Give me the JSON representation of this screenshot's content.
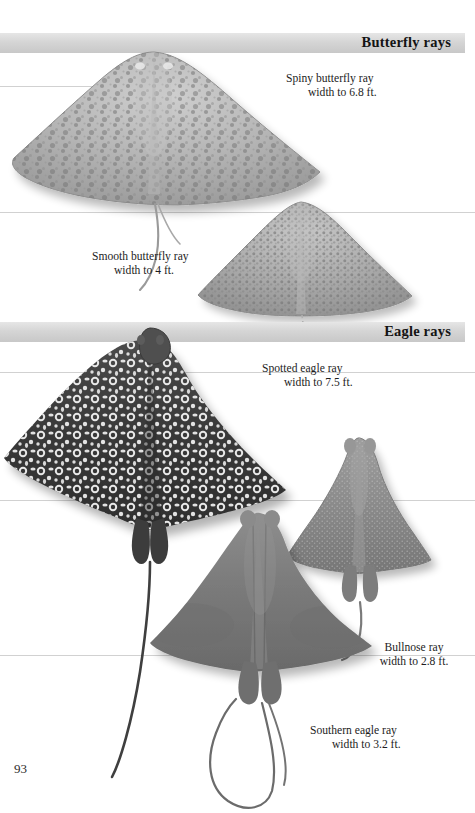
{
  "page": {
    "folio": "93",
    "background": "#ffffff",
    "band_color": "#d5d5d5",
    "rule_color": "#c9c9c9"
  },
  "sections": [
    {
      "id": "butterfly-rays",
      "label": "Butterfly rays",
      "band_top": 33
    },
    {
      "id": "eagle-rays",
      "label": "Eagle rays",
      "band_top": 322
    }
  ],
  "rules": [
    86,
    212,
    372,
    500,
    655
  ],
  "specimens": [
    {
      "id": "spiny-butterfly-ray",
      "name": "Spiny butterfly ray",
      "measure": "width to 6.8 ft.",
      "caption_x": 286,
      "caption_y": 72,
      "align": "indent",
      "body_tone": "#b9b9b9",
      "pattern": "mottled-speckle"
    },
    {
      "id": "smooth-butterfly-ray",
      "name": "Smooth butterfly ray",
      "measure": "width to 4 ft.",
      "caption_x": 92,
      "caption_y": 250,
      "align": "indent",
      "body_tone": "#adadad",
      "pattern": "dense-speckle"
    },
    {
      "id": "spotted-eagle-ray",
      "name": "Spotted eagle ray",
      "measure": "width to 7.5 ft.",
      "caption_x": 262,
      "caption_y": 362,
      "align": "indent",
      "body_tone": "#3b3b3b",
      "pattern": "white-rings"
    },
    {
      "id": "bullnose-ray",
      "name": "Bullnose ray",
      "measure": "width to 2.8 ft.",
      "caption_x": 358,
      "caption_y": 641,
      "align": "center",
      "body_tone": "#8e8e8e",
      "pattern": "fine-stipple"
    },
    {
      "id": "southern-eagle-ray",
      "name": "Southern eagle ray",
      "measure": "width to 3.2 ft.",
      "caption_x": 310,
      "caption_y": 724,
      "align": "indent",
      "body_tone": "#7d7d7d",
      "pattern": "smooth-gradient"
    }
  ]
}
